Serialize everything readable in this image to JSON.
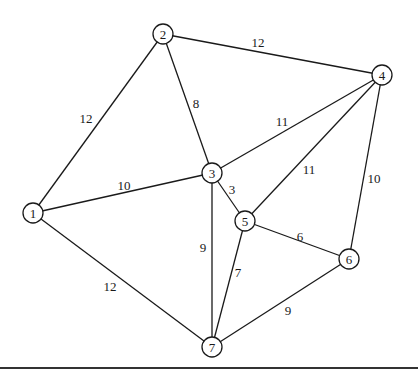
{
  "graph": {
    "nodes": [
      {
        "id": "1",
        "label": "1",
        "x": 33,
        "y": 213
      },
      {
        "id": "2",
        "label": "2",
        "x": 163,
        "y": 34
      },
      {
        "id": "3",
        "label": "3",
        "x": 212,
        "y": 173
      },
      {
        "id": "4",
        "label": "4",
        "x": 382,
        "y": 75
      },
      {
        "id": "5",
        "label": "5",
        "x": 245,
        "y": 221
      },
      {
        "id": "6",
        "label": "6",
        "x": 349,
        "y": 259
      },
      {
        "id": "7",
        "label": "7",
        "x": 212,
        "y": 347
      }
    ],
    "edges": [
      {
        "from": "1",
        "to": "2",
        "weight": "12",
        "lx": 86,
        "ly": 118
      },
      {
        "from": "2",
        "to": "4",
        "weight": "12",
        "lx": 258,
        "ly": 42
      },
      {
        "from": "2",
        "to": "3",
        "weight": "8",
        "lx": 196,
        "ly": 103
      },
      {
        "from": "1",
        "to": "3",
        "weight": "10",
        "lx": 124,
        "ly": 185
      },
      {
        "from": "3",
        "to": "4",
        "weight": "11",
        "lx": 282,
        "ly": 121
      },
      {
        "from": "4",
        "to": "5",
        "weight": "11",
        "lx": 309,
        "ly": 169
      },
      {
        "from": "4",
        "to": "6",
        "weight": "10",
        "lx": 374,
        "ly": 178
      },
      {
        "from": "3",
        "to": "5",
        "weight": "3",
        "lx": 232,
        "ly": 189
      },
      {
        "from": "3",
        "to": "7",
        "weight": "9",
        "lx": 203,
        "ly": 247
      },
      {
        "from": "5",
        "to": "6",
        "weight": "6",
        "lx": 300,
        "ly": 236
      },
      {
        "from": "5",
        "to": "7",
        "weight": "7",
        "lx": 238,
        "ly": 272
      },
      {
        "from": "1",
        "to": "7",
        "weight": "12",
        "lx": 110,
        "ly": 286
      },
      {
        "from": "6",
        "to": "7",
        "weight": "9",
        "lx": 288,
        "ly": 310
      }
    ],
    "node_radius": 10,
    "baseline_y": 368
  }
}
